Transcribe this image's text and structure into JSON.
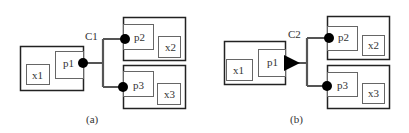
{
  "diagram": {
    "panels": [
      {
        "caption": "(a)",
        "connector": {
          "label": "C1",
          "source_marker": "circle"
        },
        "source": {
          "port": "p1",
          "component": "x1"
        },
        "targets": [
          {
            "port": "p2",
            "component": "x2",
            "marker": "circle"
          },
          {
            "port": "p3",
            "component": "x3",
            "marker": "circle"
          }
        ]
      },
      {
        "caption": "(b)",
        "connector": {
          "label": "C2",
          "source_marker": "triangle"
        },
        "source": {
          "port": "p1",
          "component": "x1"
        },
        "targets": [
          {
            "port": "p2",
            "component": "x2",
            "marker": "circle"
          },
          {
            "port": "p3",
            "component": "x3",
            "marker": "circle"
          }
        ]
      }
    ],
    "colors": {
      "stroke": "#222222",
      "inner_stroke": "#666666",
      "wire": "#555555",
      "marker": "#000000"
    }
  }
}
